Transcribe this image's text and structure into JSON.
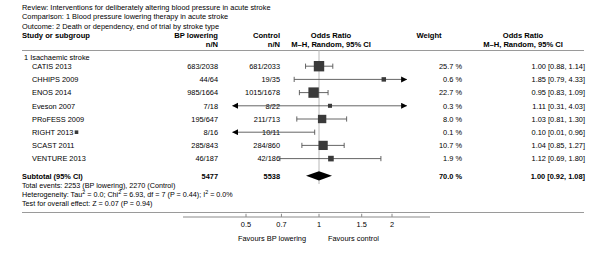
{
  "meta": {
    "review": "Review: Interventions for deliberately altering blood pressure in acute stroke",
    "comparison": "Comparison: 1 Blood pressure lowering therapy in acute stroke",
    "outcome": "Outcome: 2 Death or dependency, end of trial by stroke type"
  },
  "headers": {
    "study": "Study or subgroup",
    "bp_lowering": "BP lowering",
    "control": "Control",
    "nn": "n/N",
    "or_title": "Odds Ratio",
    "or_sub": "M–H, Random, 95% CI",
    "weight": "Weight"
  },
  "subgroup": {
    "title": "1 Isachaemic stroke"
  },
  "statistics": {
    "total_events": "Total events: 2253 (BP lowering), 2270 (Control)",
    "heterogeneity_pre": "Heterogeneity: Tau",
    "heterogeneity_mid": " = 0.0; Chi",
    "heterogeneity_chi": " = 6.93, df = 7 (P = 0.44); I",
    "heterogeneity_end": " = 0.0%",
    "sup2": "2",
    "overall_effect": "Test for overall effect: Z = 0.07 (P = 0.94)"
  },
  "axis": {
    "ticks": [
      "0.5",
      "0.7",
      "1",
      "1.5",
      "2"
    ],
    "favours_left": "Favours BP lowering",
    "favours_right": "Favours control"
  },
  "chart_data": {
    "type": "forest",
    "xlabel": "Odds Ratio",
    "xscale": "log",
    "xlim": [
      0.42,
      2.4
    ],
    "xticks": [
      0.5,
      0.7,
      1,
      1.5,
      2
    ],
    "reference_line": 1,
    "grid": false,
    "legend": "none",
    "columns": [
      "Study or subgroup",
      "BP lowering n/N",
      "Control n/N",
      "Weight",
      "Odds Ratio M-H, Random, 95% CI"
    ],
    "subgroups": [
      {
        "label": "1 Isachaemic stroke",
        "studies": [
          {
            "name": "CATIS 2013",
            "bp_nn": "683/2038",
            "ctl_nn": "681/2033",
            "weight": "25.7 %",
            "weight_value": 25.7,
            "or": 1.0,
            "ci_low": 0.88,
            "ci_high": 1.14,
            "effect_text": "1.00 [0.88, 1.14]",
            "arrow_left": false,
            "arrow_right": false
          },
          {
            "name": "CHHIPS 2009",
            "bp_nn": "44/64",
            "ctl_nn": "19/35",
            "weight": "0.6 %",
            "weight_value": 0.6,
            "or": 1.85,
            "ci_low": 0.79,
            "ci_high": 4.33,
            "effect_text": "1.85 [0.79, 4.33]",
            "arrow_left": false,
            "arrow_right": false
          },
          {
            "name": "ENOS 2014",
            "bp_nn": "985/1664",
            "ctl_nn": "1015/1678",
            "weight": "22.7 %",
            "weight_value": 22.7,
            "or": 0.95,
            "ci_low": 0.83,
            "ci_high": 1.09,
            "effect_text": "0.95 [0.83, 1.09]",
            "arrow_left": false,
            "arrow_right": false
          },
          {
            "name": "Eveson 2007",
            "bp_nn": "7/18",
            "ctl_nn": "8/22",
            "weight": "0.3 %",
            "weight_value": 0.3,
            "or": 1.11,
            "ci_low": 0.31,
            "ci_high": 4.03,
            "effect_text": "1.11 [0.31, 4.03]",
            "arrow_left": true,
            "arrow_right": true
          },
          {
            "name": "PRoFESS 2009",
            "bp_nn": "195/647",
            "ctl_nn": "211/713",
            "weight": "8.0 %",
            "weight_value": 8.0,
            "or": 1.03,
            "ci_low": 0.81,
            "ci_high": 1.3,
            "effect_text": "1.03 [0.81, 1.30]",
            "arrow_left": false,
            "arrow_right": false
          },
          {
            "name": "RIGHT 2013",
            "bp_nn": "8/16",
            "ctl_nn": "10/11",
            "weight": "0.1 %",
            "weight_value": 0.1,
            "or": 0.1,
            "ci_low": 0.01,
            "ci_high": 0.96,
            "effect_text": "0.10 [0.01, 0.96]",
            "arrow_left": true,
            "arrow_right": false
          },
          {
            "name": "SCAST 2011",
            "bp_nn": "285/843",
            "ctl_nn": "284/860",
            "weight": "10.7 %",
            "weight_value": 10.7,
            "or": 1.04,
            "ci_low": 0.85,
            "ci_high": 1.27,
            "effect_text": "1.04 [0.85, 1.27]",
            "arrow_left": false,
            "arrow_right": false
          },
          {
            "name": "VENTURE 2013",
            "bp_nn": "46/187",
            "ctl_nn": "42/186",
            "weight": "1.9 %",
            "weight_value": 1.9,
            "or": 1.12,
            "ci_low": 0.69,
            "ci_high": 1.8,
            "effect_text": "1.12 [0.69, 1.80]",
            "arrow_left": false,
            "arrow_right": false
          }
        ],
        "subtotal": {
          "name": "Subtotal (95% CI)",
          "bp_nn": "5477",
          "ctl_nn": "5538",
          "weight": "70.0 %",
          "or": 1.0,
          "ci_low": 0.92,
          "ci_high": 1.08,
          "effect_text": "1.00 [0.92, 1.08]"
        }
      }
    ]
  }
}
